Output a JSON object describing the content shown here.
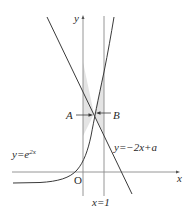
{
  "figure": {
    "type": "function-graph",
    "axes": {
      "x_label": "x",
      "y_label": "y",
      "origin_label": "O"
    },
    "curves": [
      {
        "id": "exp-curve",
        "label": "y=e",
        "exponent": "2x",
        "equation": "y=e^{2x}"
      },
      {
        "id": "line",
        "label": "y=−2x+a",
        "equation": "y=-2x+a"
      }
    ],
    "vertical_line": {
      "label": "x=1"
    },
    "regions": [
      {
        "label": "A",
        "description": "shaded region between y-axis, curve and line left of intersection"
      },
      {
        "label": "B",
        "description": "shaded region between curve, line and x=1 right of intersection"
      }
    ],
    "colors": {
      "shade": "#e6e6e6",
      "stroke": "#3a3a3a",
      "axis": "#7a7a7a"
    }
  }
}
